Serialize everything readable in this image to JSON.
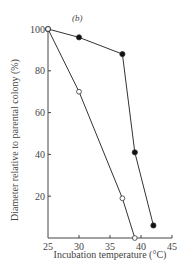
{
  "chart_data": {
    "type": "line",
    "panel_label": "(b)",
    "title": "",
    "xlabel": "Incubation temperature (°C)",
    "ylabel": "Diameter relative to parental colony (%)",
    "xlim": [
      25,
      45
    ],
    "ylim": [
      0,
      100
    ],
    "x_ticks": [
      25,
      30,
      35,
      40,
      45
    ],
    "y_ticks": [
      20,
      40,
      60,
      80,
      100
    ],
    "grid": false,
    "legend": null,
    "series": [
      {
        "name": "filled-circles",
        "marker": "filled-circle",
        "x": [
          25,
          30,
          37,
          39,
          42
        ],
        "y": [
          100,
          96,
          88,
          41,
          6
        ]
      },
      {
        "name": "open-circles",
        "marker": "open-circle",
        "x": [
          25,
          30,
          37,
          39
        ],
        "y": [
          100,
          70,
          19,
          0
        ]
      }
    ]
  },
  "labels": {
    "panel": "(b)",
    "xlabel": "Incubation temperature (°C)",
    "ylabel": "Diameter relative to parental colony (%)",
    "x_ticks": [
      "25",
      "30",
      "35",
      "40",
      "45"
    ],
    "y_ticks": [
      "20",
      "40",
      "60",
      "80",
      "100"
    ]
  }
}
